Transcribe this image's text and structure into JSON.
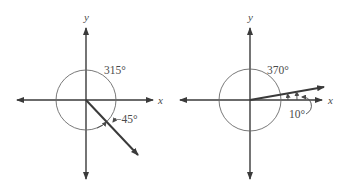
{
  "figures": [
    {
      "name": "angle-315",
      "axis_labels": {
        "x": "x",
        "y": "y"
      },
      "angle_labels": {
        "positive": "315°",
        "negative": "−45°"
      },
      "terminal_side_degrees": -45
    },
    {
      "name": "angle-370",
      "axis_labels": {
        "x": "x",
        "y": "y"
      },
      "angle_labels": {
        "coterminal": "370°",
        "reference": "10°"
      },
      "terminal_side_degrees": 10
    }
  ],
  "colors": {
    "line": "#4a4a4a",
    "circle": "#6a6a6a",
    "background": "#ffffff"
  }
}
